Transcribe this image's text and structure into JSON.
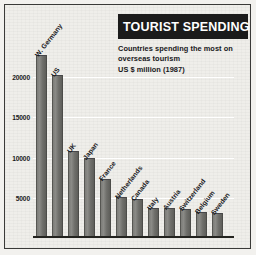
{
  "chart_data": {
    "type": "bar",
    "title": "TOURIST SPENDING",
    "subtitle_lines": [
      "Countries spending the most on",
      "overseas tourism",
      "US $ million (1987)"
    ],
    "xlabel": "",
    "ylabel": "",
    "ylim": [
      0,
      24000
    ],
    "grid": true,
    "legend": "none",
    "ticks": [
      "5000",
      "10000",
      "15000",
      "20000"
    ],
    "tick_values": [
      5000,
      10000,
      15000,
      20000
    ],
    "categories": [
      "W. Germany",
      "US",
      "UK",
      "Japan",
      "France",
      "Netherlands",
      "Canada",
      "Italy",
      "Austria",
      "Switzerland",
      "Belgium",
      "Sweden"
    ],
    "values": [
      22650,
      20100,
      10700,
      9800,
      7250,
      5000,
      4700,
      3650,
      3600,
      3500,
      3100,
      2950
    ],
    "bar_color": "#7a7a76",
    "title_background": "#1b1b1b",
    "title_color": "#ffffff",
    "plot_background": "#efeeea",
    "gridline_color": "#ffffff",
    "axis_color": "#23231f"
  }
}
